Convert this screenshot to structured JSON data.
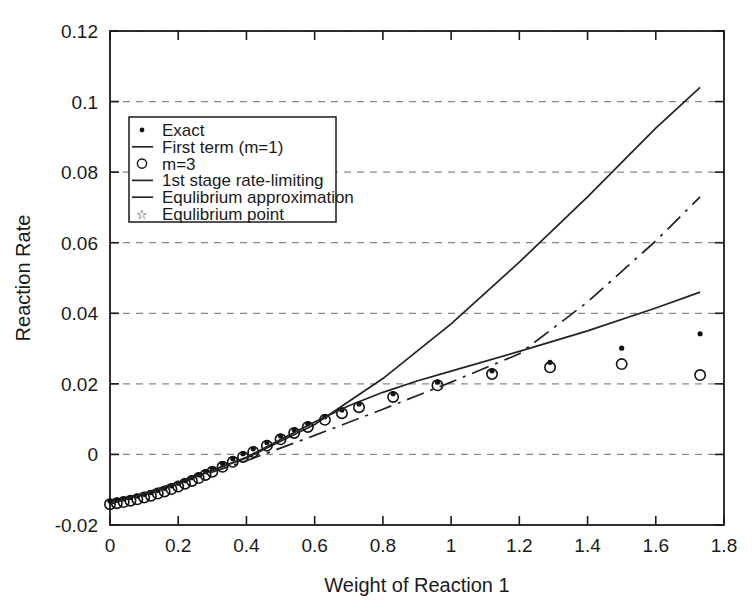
{
  "chart_data": {
    "type": "scatter",
    "title": "",
    "xlabel": "Weight of Reaction 1",
    "ylabel": "Reaction Rate",
    "xlim": [
      0,
      1.8
    ],
    "ylim": [
      -0.02,
      0.12
    ],
    "xticks": [
      "0",
      "0.2",
      "0.4",
      "0.6",
      "0.8",
      "1",
      "1.2",
      "1.4",
      "1.6",
      "1.8"
    ],
    "xtick_values": [
      0,
      0.2,
      0.4,
      0.6,
      0.8,
      1.0,
      1.2,
      1.4,
      1.6,
      1.8
    ],
    "yticks": [
      "-0.02",
      "0",
      "0.02",
      "0.04",
      "0.06",
      "0.08",
      "0.1",
      "0.12"
    ],
    "ytick_values": [
      -0.02,
      0,
      0.02,
      0.04,
      0.06,
      0.08,
      0.1,
      0.12
    ],
    "grid": "horizontal-dashed",
    "legend_position": "upper-left",
    "series": [
      {
        "name": "Exact",
        "marker": "dot",
        "style": "points",
        "x": [
          0.0,
          0.02,
          0.04,
          0.06,
          0.08,
          0.1,
          0.12,
          0.14,
          0.16,
          0.18,
          0.2,
          0.22,
          0.24,
          0.26,
          0.28,
          0.3,
          0.33,
          0.36,
          0.39,
          0.42,
          0.46,
          0.5,
          0.54,
          0.58,
          0.63,
          0.68,
          0.73,
          0.83,
          0.96,
          1.12,
          1.29,
          1.5,
          1.73
        ],
        "y": [
          -0.0132,
          -0.0129,
          -0.0126,
          -0.0122,
          -0.0118,
          -0.0113,
          -0.0108,
          -0.0102,
          -0.0096,
          -0.0089,
          -0.0082,
          -0.0074,
          -0.0066,
          -0.0058,
          -0.0049,
          -0.004,
          -0.0026,
          -0.0012,
          0.0002,
          0.0016,
          0.0034,
          0.0052,
          0.007,
          0.0087,
          0.0107,
          0.0126,
          0.0143,
          0.0172,
          0.0205,
          0.0237,
          0.0261,
          0.0301,
          0.0342
        ]
      },
      {
        "name": "First term (m=1)",
        "marker": "line",
        "style": "solid",
        "x": [
          0.0,
          0.2,
          0.4,
          0.6,
          0.8,
          1.0,
          1.2,
          1.4,
          1.6,
          1.73
        ],
        "y": [
          -0.014,
          -0.008,
          -0.001,
          0.0085,
          0.0215,
          0.037,
          0.0545,
          0.073,
          0.0925,
          0.104
        ]
      },
      {
        "name": "m=3",
        "marker": "circle",
        "style": "points",
        "x": [
          0.0,
          0.02,
          0.04,
          0.06,
          0.08,
          0.1,
          0.12,
          0.14,
          0.16,
          0.18,
          0.2,
          0.22,
          0.24,
          0.26,
          0.28,
          0.3,
          0.33,
          0.36,
          0.39,
          0.42,
          0.46,
          0.5,
          0.54,
          0.58,
          0.63,
          0.68,
          0.73,
          0.83,
          0.96,
          1.12,
          1.29,
          1.5,
          1.73
        ],
        "y": [
          -0.0132,
          -0.0129,
          -0.0126,
          -0.0122,
          -0.0118,
          -0.0113,
          -0.0108,
          -0.0102,
          -0.0096,
          -0.0089,
          -0.0082,
          -0.0074,
          -0.0066,
          -0.0058,
          -0.0049,
          -0.004,
          -0.0026,
          -0.0012,
          0.0002,
          0.0016,
          0.0034,
          0.0052,
          0.007,
          0.0087,
          0.0107,
          0.0126,
          0.0143,
          0.0172,
          0.0205,
          0.0237,
          0.0256,
          0.0265,
          0.0234
        ]
      },
      {
        "name": "1st stage rate-limiting",
        "marker": "line",
        "style": "dashdot",
        "x": [
          0.0,
          0.2,
          0.4,
          0.6,
          0.8,
          1.0,
          1.2,
          1.4,
          1.6,
          1.73
        ],
        "y": [
          -0.014,
          -0.0082,
          -0.0018,
          0.0054,
          0.0128,
          0.0205,
          0.0285,
          0.0432,
          0.0605,
          0.073
        ]
      },
      {
        "name": "Equlibrium approximation",
        "marker": "line",
        "style": "solid",
        "x": [
          0.0,
          0.1,
          0.2,
          0.3,
          0.4,
          0.5,
          0.6,
          0.7,
          0.8,
          0.9,
          1.0,
          1.2,
          1.4,
          1.6,
          1.73
        ],
        "y": [
          -0.014,
          -0.011,
          -0.008,
          -0.0045,
          -0.0008,
          0.0042,
          0.0092,
          0.0138,
          0.0176,
          0.0208,
          0.0236,
          0.0292,
          0.035,
          0.0415,
          0.046
        ]
      },
      {
        "name": "Equlibrium point",
        "marker": "star",
        "style": "points",
        "x": [],
        "y": []
      }
    ]
  },
  "legend": {
    "items": [
      {
        "label": "Exact",
        "marker": "dot"
      },
      {
        "label": "First term (m=1)",
        "marker": "line"
      },
      {
        "label": "m=3",
        "marker": "circle"
      },
      {
        "label": "1st stage rate-limiting",
        "marker": "line"
      },
      {
        "label": "Equlibrium approximation",
        "marker": "line"
      },
      {
        "label": "Equlibrium point",
        "marker": "star"
      }
    ]
  },
  "colors": {
    "line": "#222222",
    "grid": "#8a8a8a",
    "axis": "#1a1a1a",
    "background": "#ffffff",
    "marker": "#111111"
  }
}
